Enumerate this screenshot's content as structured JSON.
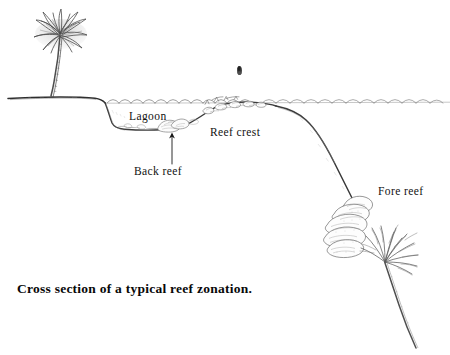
{
  "figure": {
    "title": "Cross section of a typical reef zonation.",
    "caption": "Cross section of a typical reef zonation.",
    "background_color": "#ffffff",
    "ink_color": "#1a1a1a",
    "medium": "pencil line drawing"
  },
  "labels": {
    "lagoon": "Lagoon",
    "back_reef": "Back reef",
    "reef_crest": "Reef crest",
    "fore_reef": "Fore reef"
  },
  "scene": {
    "elements": [
      "palm-tree",
      "shoreline",
      "water-surface-waves",
      "lagoon-floor",
      "back-reef-corals",
      "reef-crest-rubble",
      "fore-reef-slope",
      "brain-coral-mound",
      "sea-fan",
      "distant-bird"
    ]
  },
  "annotations": {
    "back_reef_arrow": {
      "type": "arrow",
      "direction": "up",
      "from": [
        172,
        164
      ],
      "to": [
        172,
        133
      ]
    }
  }
}
